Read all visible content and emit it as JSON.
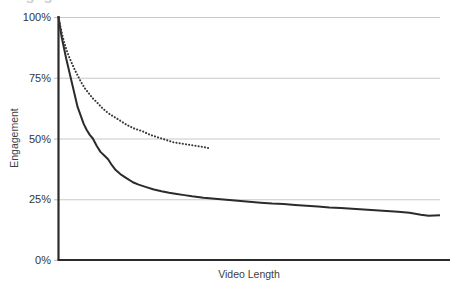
{
  "chart_data": {
    "type": "line",
    "title": "Engagement Curve",
    "title_clipped": true,
    "xlabel": "Video Length",
    "ylabel": "Engagement",
    "grid": true,
    "legend_position": "none",
    "ylim": [
      0,
      100
    ],
    "ytick_labels": [
      "100%",
      "75%",
      "50%",
      "25%",
      "0%"
    ],
    "ytick_values": [
      100,
      75,
      50,
      25,
      0
    ],
    "xtick_labels": [],
    "xlim": [
      0,
      100
    ],
    "series": [
      {
        "name": "Engagement (solid)",
        "style": "solid",
        "color": "#2b2b2b",
        "x": [
          0,
          0.4,
          0.8,
          1.2,
          1.6,
          2.0,
          2.6,
          3.2,
          3.8,
          4.4,
          5.0,
          5.8,
          6.6,
          7.4,
          8.2,
          9.0,
          10.0,
          11.0,
          12.0,
          13.0,
          14.0,
          15.0,
          16.5,
          18.0,
          19.5,
          21.0,
          23.0,
          25.0,
          27.0,
          29.0,
          31.0,
          33.0,
          35.0,
          38.0,
          41.0,
          44.0,
          47.0,
          50.0,
          53.0,
          56.0,
          59.0,
          62.0,
          65.0,
          68.0,
          71.0,
          74.0,
          77.0,
          80.0,
          83.0,
          86.0,
          89.0,
          92.0,
          95.0,
          97.0,
          100.0
        ],
        "y": [
          100,
          96,
          92,
          89,
          86,
          83,
          79,
          75,
          71,
          67,
          63,
          59.5,
          56,
          53.5,
          51.5,
          50,
          47,
          44.5,
          43,
          41.5,
          39,
          37,
          35,
          33.5,
          32,
          31,
          30,
          29,
          28.3,
          27.7,
          27.2,
          26.7,
          26.2,
          25.6,
          25.2,
          24.8,
          24.4,
          24.0,
          23.6,
          23.2,
          23.0,
          22.6,
          22.3,
          22.0,
          21.6,
          21.4,
          21.1,
          20.8,
          20.5,
          20.2,
          19.9,
          19.4,
          18.6,
          18.2,
          18.4
        ]
      },
      {
        "name": "Engagement (dotted)",
        "style": "dotted",
        "color": "#3a3a3a",
        "truncated": true,
        "x": [
          0,
          0.5,
          1.0,
          1.6,
          2.2,
          2.8,
          3.5,
          4.2,
          5.0,
          6.0,
          7.0,
          8.0,
          9.0,
          10.0,
          11.5,
          13.0,
          14.5,
          16.0,
          18.0,
          20.0,
          22.0,
          24.0,
          26.0,
          28.0,
          30.0,
          32.0,
          34.0,
          36.0,
          38.0,
          39.5
        ],
        "y": [
          100,
          96,
          92.5,
          89,
          86,
          83.5,
          81,
          78.5,
          76,
          73,
          70.5,
          68.5,
          66.5,
          65,
          62.5,
          60.5,
          59,
          57.5,
          55.5,
          54,
          53,
          51.5,
          50.5,
          49.5,
          48.5,
          48,
          47.5,
          47,
          46.5,
          46
        ]
      }
    ]
  },
  "colors": {
    "grid": "#c8c8c8",
    "axis": "#2b2b2b",
    "solid_series": "#2b2b2b",
    "dotted_series": "#3a3a3a",
    "text": "#333333",
    "title_clipped": "#cfcfd4"
  }
}
